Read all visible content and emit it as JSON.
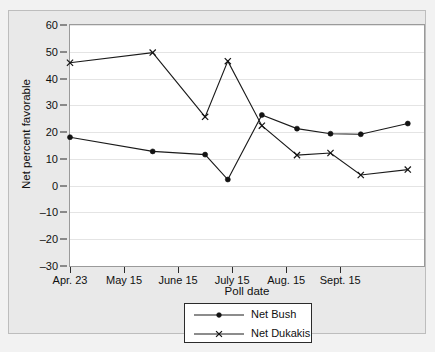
{
  "chart_data": {
    "type": "line",
    "title": "",
    "xlabel": "Poll date",
    "ylabel": "Net percent favorable",
    "ylim": [
      -30,
      60
    ],
    "yticks": [
      60,
      50,
      40,
      30,
      20,
      10,
      0,
      -10,
      -20,
      -30
    ],
    "ytick_labels": [
      "60",
      "50",
      "40",
      "30",
      "20",
      "10",
      "0",
      "–10",
      "–20",
      "–30"
    ],
    "xtick_labels": [
      "Apr. 23",
      "May 15",
      "June 15",
      "July 15",
      "Aug. 15",
      "Sept. 15"
    ],
    "xtick_positions": [
      0,
      1,
      2,
      3,
      4,
      5
    ],
    "grid": true,
    "legend_position": "below-center",
    "x": [
      0,
      1.53,
      2.5,
      2.92,
      3.55,
      4.2,
      4.82,
      5.38,
      5.77,
      6.25
    ],
    "series": [
      {
        "name": "Net Bush",
        "marker": "filled-circle",
        "values": [
          18.1,
          12.8,
          11.6,
          2.3,
          26.4,
          21.3,
          19.4,
          19.2,
          23.2
        ],
        "x": [
          0,
          1.53,
          2.5,
          2.92,
          3.55,
          4.2,
          4.82,
          5.38,
          6.25
        ]
      },
      {
        "name": "Net Dukakis",
        "marker": "x",
        "values": [
          45.9,
          49.7,
          25.7,
          46.5,
          22.4,
          11.4,
          12.2,
          4.0,
          6.0
        ],
        "x": [
          0,
          1.53,
          2.5,
          2.92,
          3.55,
          4.2,
          4.82,
          5.38,
          6.25
        ]
      }
    ]
  },
  "legend": {
    "items": [
      {
        "label": "Net Bush",
        "marker": "filled-circle"
      },
      {
        "label": "Net Dukakis",
        "marker": "x"
      }
    ]
  },
  "colors": {
    "figure_background": "#e9e9e9",
    "plot_background": "#ffffff",
    "gridline": "#e4e4e4",
    "series_line": "#1a1a1a",
    "axis": "#2b2b2b",
    "text": "#101010"
  }
}
